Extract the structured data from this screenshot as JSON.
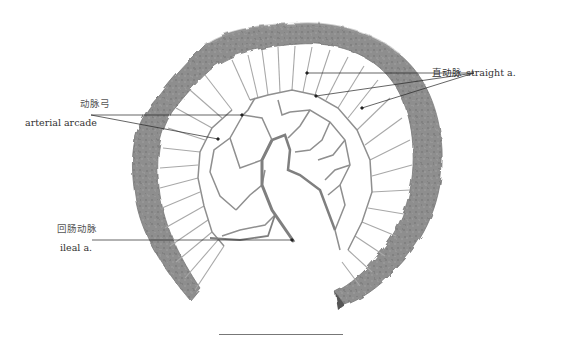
{
  "figure": {
    "labels": {
      "straight_arteries": {
        "cn": "直动脉",
        "en": "straight a."
      },
      "arterial_arcade": {
        "cn": "动脉弓",
        "en": "arterial arcade"
      },
      "ileal_artery": {
        "cn": "回肠动脉",
        "en": "ileal a."
      }
    },
    "colors": {
      "intestine": "#8c8c8c",
      "intestine_dark": "#6a6a6a",
      "vessel": "#9a9a9a",
      "leader_line": "#222222",
      "background": "#ffffff"
    },
    "scale_bar": {
      "present": true
    }
  }
}
